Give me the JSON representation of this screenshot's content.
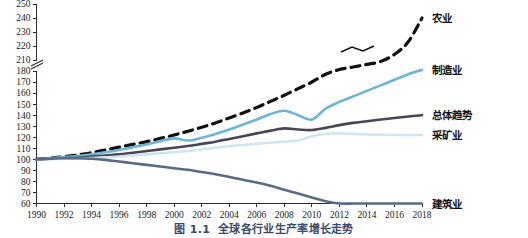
{
  "figure": {
    "caption_number": "图 1.1",
    "caption_title": "全球各行业生产率增长走势"
  },
  "chart_data": {
    "type": "line",
    "title": "全球各行业生产率增长走势",
    "xlabel": "",
    "ylabel": "",
    "grid": false,
    "legend_position": "right-inline",
    "xlim": [
      1990,
      2018
    ],
    "ylim": [
      60,
      250
    ],
    "y_axis_break": {
      "present": true,
      "between": [
        180,
        210
      ]
    },
    "xticks": [
      1990,
      1992,
      1994,
      1996,
      1998,
      2000,
      2002,
      2004,
      2006,
      2008,
      2010,
      2012,
      2014,
      2016,
      2018
    ],
    "yticks": [
      60,
      70,
      80,
      90,
      100,
      110,
      120,
      130,
      140,
      150,
      160,
      170,
      180,
      210,
      220,
      230,
      240,
      250
    ],
    "annotations": [
      {
        "text": "axis-break-squiggle",
        "on_series": "农业",
        "near_x": 2012
      }
    ],
    "x": [
      1990,
      1991,
      1992,
      1993,
      1994,
      1995,
      1996,
      1997,
      1998,
      1999,
      2000,
      2001,
      2002,
      2003,
      2004,
      2005,
      2006,
      2007,
      2008,
      2009,
      2010,
      2011,
      2012,
      2013,
      2014,
      2015,
      2016,
      2017,
      2018
    ],
    "series": [
      {
        "name": "农业",
        "label": "农业",
        "color": "#111111",
        "style": "dashed",
        "width": 3.2,
        "label_value": 240,
        "values": [
          100,
          101,
          102.5,
          104,
          106,
          108.5,
          111,
          113.5,
          116,
          119,
          122,
          125.5,
          129,
          133,
          137.5,
          142,
          147,
          152.5,
          158,
          164,
          170,
          177,
          184,
          191,
          198,
          206,
          214,
          223,
          240
        ]
      },
      {
        "name": "制造业",
        "label": "制造业",
        "color": "#6cb4d8",
        "style": "solid",
        "width": 2.6,
        "label_value": 183,
        "values": [
          100,
          101,
          102,
          103,
          104.5,
          106.5,
          108.5,
          111,
          113.5,
          116.5,
          119,
          117,
          119.5,
          123,
          127,
          131.5,
          136,
          141,
          144,
          140,
          136,
          146,
          152,
          157,
          162,
          167,
          172,
          177,
          183
        ]
      },
      {
        "name": "总体趋势",
        "label": "总体趋势",
        "color": "#4a4458",
        "style": "solid",
        "width": 2.6,
        "label_value": 140,
        "values": [
          100,
          100.5,
          101,
          101.5,
          102.5,
          103.5,
          104.5,
          106,
          107.5,
          109,
          110.5,
          112,
          114,
          116,
          118.5,
          121,
          123.5,
          126,
          128,
          127,
          126.5,
          128.5,
          131,
          133,
          134.5,
          136,
          137.5,
          138.8,
          140
        ]
      },
      {
        "name": "采矿业",
        "label": "采矿业",
        "color": "#cde7f2",
        "style": "solid",
        "width": 2.6,
        "label_value": 122,
        "values": [
          100,
          100.2,
          100.5,
          100.8,
          101.2,
          101.8,
          102.5,
          103.5,
          104.5,
          105.5,
          106.5,
          107.5,
          109,
          110.5,
          112,
          113,
          114,
          115,
          116,
          117,
          121,
          123,
          123.5,
          123,
          122.5,
          122.2,
          122,
          122,
          122
        ]
      },
      {
        "name": "建筑业",
        "label": "建筑业",
        "color": "#5a6a85",
        "style": "solid",
        "width": 2.6,
        "label_value": 60,
        "values": [
          100,
          100.5,
          101,
          101,
          100.5,
          99.5,
          98,
          96.5,
          95,
          93.5,
          92,
          90.5,
          88.5,
          86.5,
          84,
          81.5,
          79,
          76,
          72.5,
          69,
          65.5,
          62,
          60,
          60,
          60,
          60,
          60,
          60,
          60
        ]
      }
    ]
  }
}
